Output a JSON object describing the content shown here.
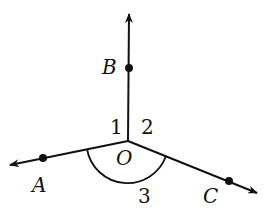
{
  "diagram": {
    "points": {
      "O": {
        "label": "O",
        "x": 128,
        "y": 141
      },
      "A": {
        "label": "A",
        "x": 43,
        "y": 158
      },
      "B": {
        "label": "B",
        "x": 129,
        "y": 68
      },
      "C": {
        "label": "C",
        "x": 229,
        "y": 181
      }
    },
    "rays": [
      {
        "name": "OA",
        "from": "O",
        "to": "A",
        "arrow": true
      },
      {
        "name": "OB",
        "from": "O",
        "to": "B",
        "arrow": true
      },
      {
        "name": "OC",
        "from": "O",
        "to": "C",
        "arrow": true
      }
    ],
    "angles": [
      {
        "label": "1",
        "between": [
          "OA",
          "OB"
        ]
      },
      {
        "label": "2",
        "between": [
          "OB",
          "OC"
        ]
      },
      {
        "label": "3",
        "between": [
          "OA",
          "OC"
        ],
        "arc": true
      }
    ],
    "stroke_color": "#111111"
  }
}
